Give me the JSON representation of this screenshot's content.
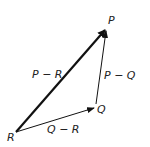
{
  "diagram": {
    "type": "vector-triangle",
    "vertices": {
      "R": {
        "label": "R",
        "x": 16,
        "y": 132
      },
      "Q": {
        "label": "Q",
        "x": 95,
        "y": 108
      },
      "P": {
        "label": "P",
        "x": 106,
        "y": 29
      }
    },
    "vectors": [
      {
        "from": "R",
        "to": "P",
        "label": "P − R",
        "weight": "bold"
      },
      {
        "from": "R",
        "to": "Q",
        "label": "Q − R",
        "weight": "thin"
      },
      {
        "from": "Q",
        "to": "P",
        "label": "P − Q",
        "weight": "thin"
      }
    ],
    "colors": {
      "stroke": "#111111",
      "text": "#222222",
      "background": "#ffffff"
    }
  }
}
